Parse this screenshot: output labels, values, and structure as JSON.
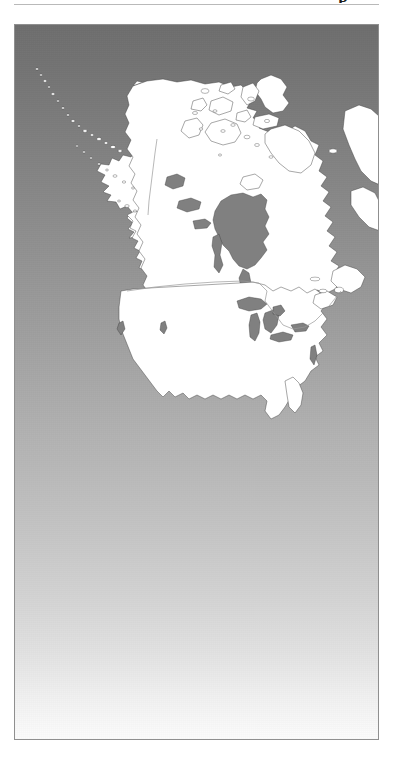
{
  "page": {
    "kind": "scanned-figure-page",
    "background_color": "#ffffff",
    "top_rule_color": "#b9b9b9",
    "clipped_glyph": "p"
  },
  "figure": {
    "name": "north-america-map",
    "caption": "",
    "frame_border_color": "#8f8f8f",
    "background": {
      "type": "vertical-gradient",
      "top_color": "#6e6e6e",
      "mid_color": "#a8a8a8",
      "bottom_color": "#fbfbfb"
    },
    "land_fill": "#ffffff",
    "land_stroke": "#3c3c3c",
    "water_fill": "#808080",
    "border_line_color": "#9a9a9a"
  },
  "map": {
    "title": "North America",
    "projection_note": "",
    "regions": [
      {
        "name": "Alaska",
        "type": "landmass"
      },
      {
        "name": "Aleutian Islands",
        "type": "island-chain"
      },
      {
        "name": "Canada",
        "type": "landmass"
      },
      {
        "name": "Canadian Arctic Archipelago",
        "type": "island-group"
      },
      {
        "name": "Greenland (partial)",
        "type": "landmass"
      },
      {
        "name": "Newfoundland",
        "type": "island"
      },
      {
        "name": "Nova Scotia",
        "type": "landmass"
      },
      {
        "name": "Contiguous United States",
        "type": "landmass"
      }
    ],
    "water_bodies": [
      {
        "name": "Hudson Bay"
      },
      {
        "name": "Lake Winnipeg"
      },
      {
        "name": "Great Bear Lake"
      },
      {
        "name": "Great Slave Lake"
      },
      {
        "name": "Lake Superior"
      },
      {
        "name": "Lake Michigan"
      },
      {
        "name": "Lake Huron"
      },
      {
        "name": "Lake Erie"
      },
      {
        "name": "Lake Ontario"
      },
      {
        "name": "Great Salt Lake"
      },
      {
        "name": "Lake Athabasca"
      }
    ],
    "borders": [
      {
        "name": "Alaska-Canada border"
      },
      {
        "name": "United States-Canada border (49th parallel)"
      }
    ]
  }
}
